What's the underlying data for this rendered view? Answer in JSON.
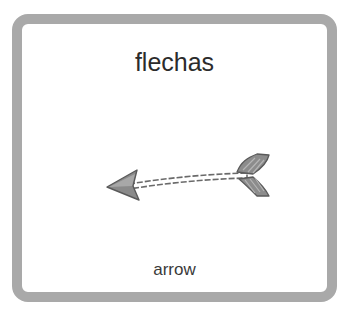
{
  "card": {
    "title": "flechas",
    "caption": "arrow",
    "icon": "arrow-left-icon",
    "border_color": "#a9a9a9"
  }
}
